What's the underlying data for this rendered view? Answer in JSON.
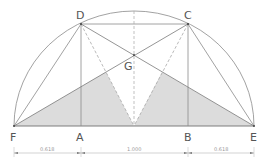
{
  "diagram": {
    "colors": {
      "line": "#8a8a8a",
      "dashed": "#a8a8a8",
      "shade": "#d9d9d9",
      "label": "#555555",
      "dim": "#999999"
    },
    "points": {
      "D": {
        "label": "D",
        "x": 81,
        "y": 24
      },
      "C": {
        "label": "C",
        "x": 188,
        "y": 24
      },
      "G": {
        "label": "G",
        "x": 134,
        "y": 55
      },
      "F": {
        "label": "F",
        "x": 14,
        "y": 126
      },
      "A": {
        "label": "A",
        "x": 81,
        "y": 126
      },
      "B": {
        "label": "B",
        "x": 188,
        "y": 126
      },
      "E": {
        "label": "E",
        "x": 254,
        "y": 126
      }
    },
    "dimensions": [
      {
        "from": "F",
        "to": "A",
        "label": "0.618"
      },
      {
        "from": "A",
        "to": "B",
        "label": "1.000"
      },
      {
        "from": "B",
        "to": "E",
        "label": "0.618"
      }
    ]
  }
}
